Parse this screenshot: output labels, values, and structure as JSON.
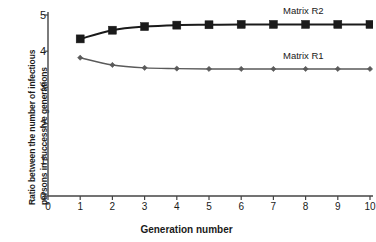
{
  "chart_data": {
    "type": "line",
    "title": "",
    "xlabel": "Generation number",
    "ylabel": "Ratio between the number of infectious persons in successive generations",
    "ylabel_line1": "Ratio between the number of infectious",
    "ylabel_line2": "persons in successive generations",
    "x": [
      1,
      2,
      3,
      4,
      5,
      6,
      7,
      8,
      9,
      10
    ],
    "xlim": [
      0,
      10
    ],
    "ylim": [
      0,
      5
    ],
    "xticks": [
      "0",
      "1",
      "2",
      "3",
      "4",
      "5",
      "6",
      "7",
      "8",
      "9",
      "10"
    ],
    "yticks": [
      "0",
      "1",
      "2",
      "3",
      "4",
      "5"
    ],
    "grid": false,
    "legend_position": "inline-right",
    "series": [
      {
        "name": "Matrix R2",
        "color": "#1a1a1a",
        "marker": "square",
        "values": [
          4.34,
          4.58,
          4.68,
          4.72,
          4.73,
          4.74,
          4.74,
          4.74,
          4.74,
          4.74
        ]
      },
      {
        "name": "Matrix R1",
        "color": "#5a5a5a",
        "marker": "diamond",
        "values": [
          3.82,
          3.62,
          3.54,
          3.52,
          3.51,
          3.51,
          3.51,
          3.51,
          3.51,
          3.51
        ]
      }
    ],
    "annotations": [
      {
        "text": "Matrix R2",
        "series": "Matrix R2"
      },
      {
        "text": "Matrix R1",
        "series": "Matrix R1"
      }
    ]
  },
  "axis": {
    "color": "#444444"
  }
}
